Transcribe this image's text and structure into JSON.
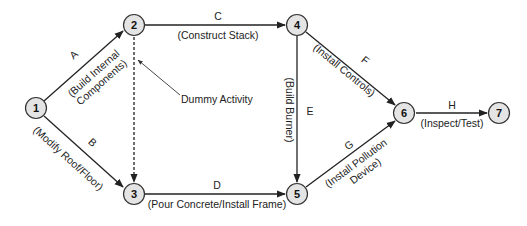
{
  "diagram": {
    "type": "activity-on-arrow network",
    "nodes": [
      {
        "id": "1",
        "label": "1"
      },
      {
        "id": "2",
        "label": "2"
      },
      {
        "id": "3",
        "label": "3"
      },
      {
        "id": "4",
        "label": "4"
      },
      {
        "id": "5",
        "label": "5"
      },
      {
        "id": "6",
        "label": "6"
      },
      {
        "id": "7",
        "label": "7"
      }
    ],
    "activities": {
      "A": {
        "code": "A",
        "desc_line1": "(Build Internal",
        "desc_line2": "Components)",
        "from": "1",
        "to": "2"
      },
      "B": {
        "code": "B",
        "desc": "(Modify Roof/Floor)",
        "from": "1",
        "to": "3"
      },
      "C": {
        "code": "C",
        "desc": "(Construct Stack)",
        "from": "2",
        "to": "4"
      },
      "D": {
        "code": "D",
        "desc": "(Pour Concrete/Install Frame)",
        "from": "3",
        "to": "5"
      },
      "E": {
        "code": "E",
        "desc": "(Build Burner)",
        "from": "4",
        "to": "5"
      },
      "F": {
        "code": "F",
        "desc": "(Install Controls)",
        "from": "4",
        "to": "6"
      },
      "G": {
        "code": "G",
        "desc_line1": "(Install Pollution",
        "desc_line2": "Device)",
        "from": "5",
        "to": "6"
      },
      "H": {
        "code": "H",
        "desc": "(Inspect/Test)",
        "from": "6",
        "to": "7"
      }
    },
    "dummy": {
      "label": "Dummy Activity",
      "from": "2",
      "to": "3"
    }
  }
}
